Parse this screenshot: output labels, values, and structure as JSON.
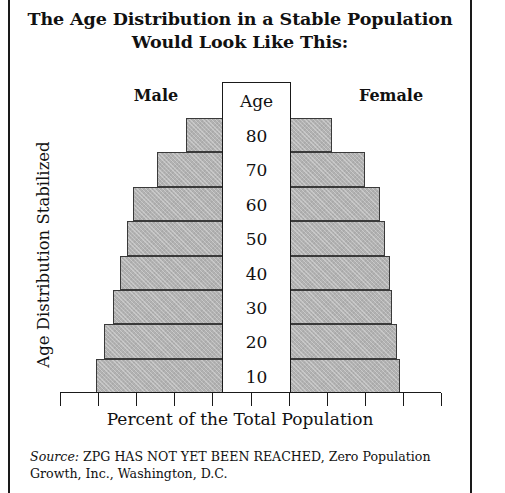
{
  "title": "The Age Distribution in a Stable Population Would Look Like This:",
  "title_line1": "The Age Distribution in a Stable Population",
  "title_line2": "Would Look Like This:",
  "headers": {
    "male": "Male",
    "female": "Female",
    "age_column": "Age"
  },
  "axis": {
    "ylabel": "Age Distribution Stabilized",
    "xlabel": "Percent of the Total Population"
  },
  "source": {
    "prefix": "Source:",
    "text": " ZPG HAS NOT YET BEEN REACHED, Zero Population Growth, Inc., Washington, D.C."
  },
  "colors": {
    "bar_fill": "#b2b2b2",
    "bar_border": "#3a3a3a",
    "frame": "#1a1a1a",
    "text": "#111111"
  },
  "chart_data": {
    "type": "bar",
    "subtype": "population-pyramid",
    "title": "The Age Distribution in a Stable Population Would Look Like This:",
    "xlabel": "Percent of the Total Population",
    "ylabel": "Age Distribution Stabilized",
    "grid": false,
    "legend": "none",
    "orientation": "horizontal-diverging",
    "age_axis_title": "Age",
    "categories": [
      "80",
      "70",
      "60",
      "50",
      "40",
      "30",
      "20",
      "10"
    ],
    "category_order": "top-to-bottom",
    "series": [
      {
        "name": "Male",
        "side": "left",
        "values": [
          3.1,
          4.8,
          5.6,
          5.9,
          6.2,
          6.7,
          7.1,
          7.6
        ]
      },
      {
        "name": "Female",
        "side": "right",
        "values": [
          3.1,
          4.8,
          5.6,
          5.9,
          6.2,
          6.7,
          7.1,
          7.6
        ]
      }
    ],
    "bars_px": {
      "note": "pixel extents measured from the plot; center column spans 222-291",
      "male_left_edges": [
        186,
        157,
        133,
        127,
        120,
        113,
        104,
        96
      ],
      "female_right_edges": [
        332,
        365,
        380,
        385,
        390,
        392,
        397,
        400
      ]
    },
    "xticks_count": 11,
    "xtick_labels": []
  }
}
